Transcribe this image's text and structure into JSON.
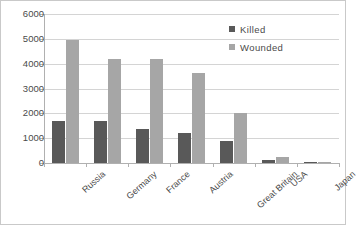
{
  "chart_data": {
    "type": "bar",
    "title": "",
    "xlabel": "",
    "ylabel": "",
    "ylim": [
      0,
      6000
    ],
    "ytick_labels": [
      "6000",
      "5000",
      "4000",
      "3000",
      "2000",
      "1000",
      "0"
    ],
    "ytick_values": [
      6000,
      5000,
      4000,
      3000,
      2000,
      1000,
      0
    ],
    "grid": true,
    "legend_position": "top-right",
    "categories": [
      "Russia",
      "Germany",
      "France",
      "Austria",
      "Great Britain",
      "USA",
      "Japan"
    ],
    "series": [
      {
        "name": "Killed",
        "color": "#595959",
        "values": [
          1700,
          1700,
          1350,
          1200,
          900,
          110,
          30
        ]
      },
      {
        "name": "Wounded",
        "color": "#a6a6a6",
        "values": [
          4950,
          4200,
          4200,
          3620,
          2000,
          240,
          30
        ]
      }
    ]
  },
  "legend": {
    "items": [
      {
        "label": "Killed",
        "swatch": "killed"
      },
      {
        "label": "Wounded",
        "swatch": "wounded"
      }
    ]
  },
  "colors": {
    "killed": "#595959",
    "wounded": "#a6a6a6",
    "gridline": "#d4d4d4",
    "axis": "#b0b0b0",
    "text": "#4a4a4a",
    "background": "#ffffff",
    "frame": "#c9c9c9"
  }
}
